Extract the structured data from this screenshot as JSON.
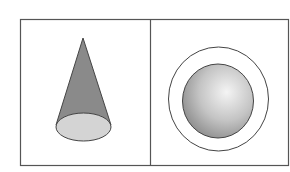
{
  "figure": {
    "panels": [
      {
        "name": "cone-panel",
        "shape": "cone",
        "description": "Cone viewed from the side with elliptical base"
      },
      {
        "name": "sphere-panel",
        "shape": "sphere-with-ring",
        "description": "Shaded sphere inside a concentric circle"
      }
    ],
    "colors": {
      "border": "#555555",
      "cone_body": "#8a8a8a",
      "cone_base": "#d4d4d4",
      "sphere_light": "#f2f2f2",
      "sphere_dark": "#8c8c8c",
      "background": "#ffffff"
    }
  }
}
